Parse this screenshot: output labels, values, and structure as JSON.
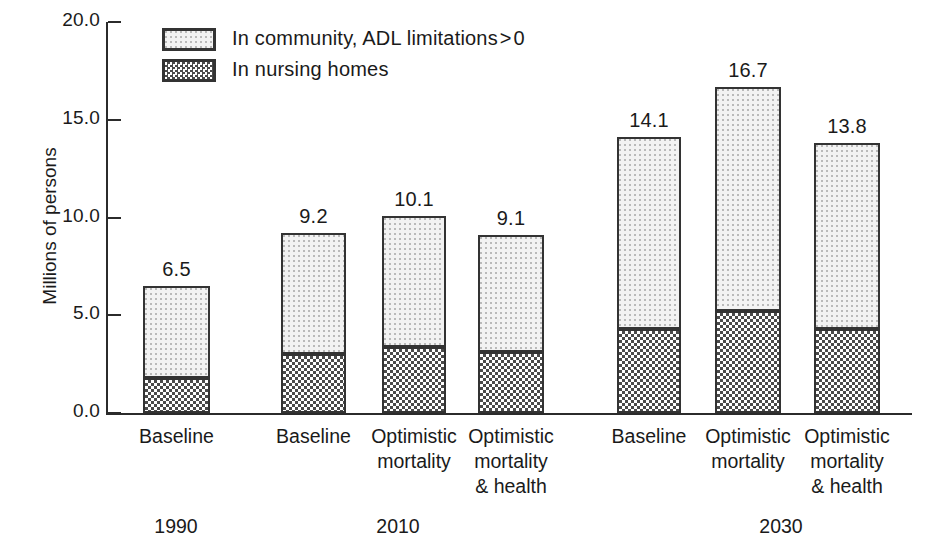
{
  "chart_data": {
    "type": "bar",
    "subtype": "stacked",
    "title": "",
    "xlabel": "",
    "ylabel": "Millions of persons",
    "ylim": [
      0.0,
      20.0
    ],
    "yticks": [
      "0.0",
      "5.0",
      "10.0",
      "15.0",
      "20.0"
    ],
    "ytick_values": [
      0.0,
      5.0,
      10.0,
      15.0,
      20.0
    ],
    "grid": false,
    "legend_position": "top-left",
    "legend": [
      {
        "name": "In community, ADL limitations > 0",
        "key": "community",
        "pattern": "light-dotted"
      },
      {
        "name": "In nursing homes",
        "key": "nursing",
        "pattern": "dense-checkerboard"
      }
    ],
    "groups": [
      {
        "label": "1990",
        "bar_indices": [
          0
        ]
      },
      {
        "label": "2010",
        "bar_indices": [
          1,
          2,
          3
        ]
      },
      {
        "label": "2030",
        "bar_indices": [
          4,
          5,
          6
        ]
      }
    ],
    "categories": [
      "Baseline",
      "Baseline",
      "Optimistic\nmortality",
      "Optimistic\nmortality\n& health",
      "Baseline",
      "Optimistic\nmortality",
      "Optimistic\nmortality\n& health"
    ],
    "totals": [
      6.5,
      9.2,
      10.1,
      9.1,
      14.1,
      16.7,
      13.8
    ],
    "total_labels": [
      "6.5",
      "9.2",
      "10.1",
      "9.1",
      "14.1",
      "16.7",
      "13.8"
    ],
    "series": [
      {
        "name": "In nursing homes",
        "key": "nursing",
        "values": [
          1.8,
          3.0,
          3.4,
          3.1,
          4.3,
          5.2,
          4.3
        ]
      },
      {
        "name": "In community, ADL limitations > 0",
        "key": "community",
        "values": [
          4.7,
          6.2,
          6.7,
          6.0,
          9.8,
          11.5,
          9.5
        ]
      }
    ],
    "colors": {
      "axis": "#2b2b2b",
      "outline": "#333333",
      "community_fill": "#f2f2f2",
      "nursing_fill": "#e8e8e8",
      "text": "#1a1a1a"
    },
    "geometry": {
      "plot_left": 106,
      "plot_right": 912,
      "y_zero_px": 413,
      "y_top_px": 22,
      "bars": [
        {
          "x": 143,
          "w": 67
        },
        {
          "x": 281,
          "w": 65
        },
        {
          "x": 382,
          "w": 64
        },
        {
          "x": 478,
          "w": 66
        },
        {
          "x": 617,
          "w": 64
        },
        {
          "x": 715,
          "w": 66
        },
        {
          "x": 814,
          "w": 66
        }
      ],
      "group_label_x": [
        176,
        398,
        781
      ],
      "group_label_y": 515
    }
  }
}
